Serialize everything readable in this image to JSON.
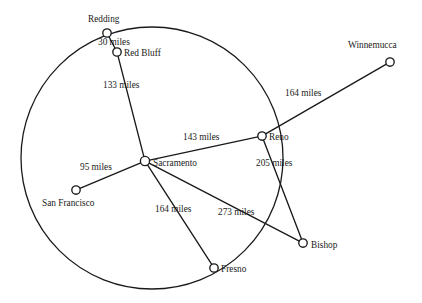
{
  "diagram": {
    "type": "weighted-graph-map",
    "background_color": "#ffffff",
    "stroke_color": "#1a1a1a",
    "circle": {
      "label": "enclosing-circle",
      "cx": 152,
      "cy": 158,
      "r": 131
    },
    "nodes": [
      {
        "id": "redding",
        "label": "Redding",
        "x": 107,
        "y": 33,
        "r": 4.2,
        "label_x": 88,
        "label_y": 22,
        "anchor": "start"
      },
      {
        "id": "red-bluff",
        "label": "Red Bluff",
        "x": 117,
        "y": 52,
        "r": 4.2,
        "label_x": 124,
        "label_y": 56,
        "anchor": "start"
      },
      {
        "id": "winnemucca",
        "label": "Winnemucca",
        "x": 390,
        "y": 62,
        "r": 4.2,
        "label_x": 348,
        "label_y": 48,
        "anchor": "start"
      },
      {
        "id": "reno",
        "label": "Reno",
        "x": 262,
        "y": 136,
        "r": 4.2,
        "label_x": 269,
        "label_y": 140,
        "anchor": "start"
      },
      {
        "id": "sacramento",
        "label": "Sacramento",
        "x": 145,
        "y": 161,
        "r": 4.6,
        "label_x": 153,
        "label_y": 166,
        "anchor": "start"
      },
      {
        "id": "san-francisco",
        "label": "San Francisco",
        "x": 76,
        "y": 190,
        "r": 4.2,
        "label_x": 42,
        "label_y": 206,
        "anchor": "start"
      },
      {
        "id": "bishop",
        "label": "Bishop",
        "x": 303,
        "y": 243,
        "r": 4.2,
        "label_x": 311,
        "label_y": 248,
        "anchor": "start"
      },
      {
        "id": "fresno",
        "label": "Fresno",
        "x": 214,
        "y": 268,
        "r": 4.2,
        "label_x": 221,
        "label_y": 272,
        "anchor": "start"
      }
    ],
    "edges": [
      {
        "id": "redding-red-bluff",
        "from": "redding",
        "to": "red-bluff",
        "label": "30 miles",
        "label_x": 98,
        "label_y": 45,
        "anchor": "start"
      },
      {
        "id": "red-bluff-sacramento",
        "from": "red-bluff",
        "to": "sacramento",
        "label": "133 miles",
        "label_x": 103,
        "label_y": 88,
        "anchor": "start"
      },
      {
        "id": "sacramento-reno",
        "from": "sacramento",
        "to": "reno",
        "label": "143 miles",
        "label_x": 183,
        "label_y": 140,
        "anchor": "start"
      },
      {
        "id": "reno-winnemucca",
        "from": "reno",
        "to": "winnemucca",
        "label": "164 miles",
        "label_x": 285,
        "label_y": 96,
        "anchor": "start"
      },
      {
        "id": "sacramento-san-francisco",
        "from": "sacramento",
        "to": "san-francisco",
        "label": "95 miles",
        "label_x": 80,
        "label_y": 170,
        "anchor": "start"
      },
      {
        "id": "sacramento-fresno",
        "from": "sacramento",
        "to": "fresno",
        "label": "164 miles",
        "label_x": 155,
        "label_y": 212,
        "anchor": "start"
      },
      {
        "id": "sacramento-bishop",
        "from": "sacramento",
        "to": "bishop",
        "label": "273 miles",
        "label_x": 218,
        "label_y": 215,
        "anchor": "start"
      },
      {
        "id": "reno-bishop",
        "from": "reno",
        "to": "bishop",
        "label": "205 miles",
        "label_x": 256,
        "label_y": 166,
        "anchor": "start"
      }
    ]
  }
}
